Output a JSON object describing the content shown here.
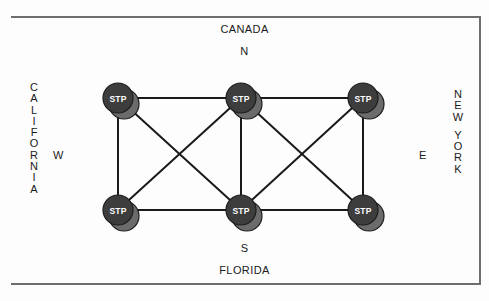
{
  "diagram": {
    "title_top": "CANADA",
    "title_bottom": "FLORIDA",
    "label_left": "CALIFORNIA",
    "label_right_line1": "NEW",
    "label_right_line2": "YORK",
    "compass": {
      "north": "N",
      "south": "S",
      "west": "W",
      "east": "E"
    },
    "node_label": "STP",
    "colors": {
      "node_fill": "#3d3d3d",
      "node_shadow": "#6b6b6b",
      "node_stroke": "#1c1c1c",
      "edge": "#1a1a1a",
      "frame": "#6e6e6e",
      "text": "#1a1a1a",
      "node_text": "#ffffff",
      "background": "#fdfdfd"
    },
    "nodes": [
      {
        "id": "n1",
        "label": "STP",
        "x": 118,
        "y": 98,
        "row": "top",
        "col": 0
      },
      {
        "id": "n2",
        "label": "STP",
        "x": 241,
        "y": 98,
        "row": "top",
        "col": 1
      },
      {
        "id": "n3",
        "label": "STP",
        "x": 363,
        "y": 98,
        "row": "top",
        "col": 2
      },
      {
        "id": "n4",
        "label": "STP",
        "x": 118,
        "y": 210,
        "row": "bottom",
        "col": 0
      },
      {
        "id": "n5",
        "label": "STP",
        "x": 241,
        "y": 210,
        "row": "bottom",
        "col": 1
      },
      {
        "id": "n6",
        "label": "STP",
        "x": 363,
        "y": 210,
        "row": "bottom",
        "col": 2
      }
    ],
    "edges": [
      {
        "from": "n1",
        "to": "n2"
      },
      {
        "from": "n2",
        "to": "n3"
      },
      {
        "from": "n4",
        "to": "n5"
      },
      {
        "from": "n5",
        "to": "n6"
      },
      {
        "from": "n1",
        "to": "n4"
      },
      {
        "from": "n2",
        "to": "n5"
      },
      {
        "from": "n3",
        "to": "n6"
      },
      {
        "from": "n1",
        "to": "n5"
      },
      {
        "from": "n2",
        "to": "n4"
      },
      {
        "from": "n2",
        "to": "n6"
      },
      {
        "from": "n3",
        "to": "n5"
      }
    ],
    "node_radius": 15,
    "shadow_offset_x": 6,
    "shadow_offset_y": 6
  }
}
